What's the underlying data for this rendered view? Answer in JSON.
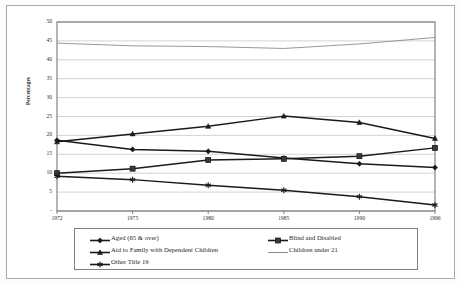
{
  "chart_data": {
    "type": "line",
    "title": "",
    "xlabel": "",
    "ylabel": "Percentages",
    "categories": [
      "1972",
      "1975",
      "1980",
      "1985",
      "1990",
      "1996"
    ],
    "ylim": [
      0,
      50
    ],
    "ytick_step": 5,
    "yticks": [
      "50",
      "45",
      "40",
      "35",
      "30",
      "25",
      "20",
      "15",
      "10",
      "5",
      "-"
    ],
    "grid": "horizontal",
    "legend_position": "bottom",
    "series": [
      {
        "name": "Aged (65 & over)",
        "marker": "diamond",
        "color": "#1a1a1a",
        "values": [
          18.7,
          16.3,
          15.8,
          14.0,
          12.5,
          11.5
        ]
      },
      {
        "name": "Blind and Disabled",
        "marker": "square",
        "color": "#1a1a1a",
        "values": [
          10.0,
          11.2,
          13.5,
          13.8,
          14.5,
          16.7
        ]
      },
      {
        "name": "Aid to Family with Dependent Children",
        "marker": "triangle",
        "color": "#1a1a1a",
        "values": [
          18.3,
          20.4,
          22.4,
          25.1,
          23.4,
          19.2
        ]
      },
      {
        "name": "Children under 21",
        "marker": "none",
        "color": "#8c8c8c",
        "values": [
          44.4,
          43.7,
          43.5,
          43.0,
          44.2,
          45.9
        ]
      },
      {
        "name": "Other Title 19",
        "marker": "star",
        "color": "#1a1a1a",
        "values": [
          9.2,
          8.3,
          6.8,
          5.5,
          3.8,
          1.6
        ]
      }
    ]
  },
  "axis": {
    "y_title": "Percentages"
  },
  "legend": {
    "rows": [
      [
        {
          "label": "Aged (65 & over)",
          "marker": "diamond",
          "color": "#1a1a1a"
        },
        {
          "label": "Blind and Disabled",
          "marker": "square",
          "color": "#1a1a1a"
        }
      ],
      [
        {
          "label": "Aid to Family with Dependent Children",
          "marker": "triangle",
          "color": "#1a1a1a"
        },
        {
          "label": "Children under 21",
          "marker": "none",
          "color": "#8c8c8c"
        }
      ],
      [
        {
          "label": "Other Title 19",
          "marker": "star",
          "color": "#1a1a1a"
        }
      ]
    ]
  }
}
